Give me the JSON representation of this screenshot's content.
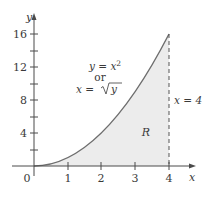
{
  "figure": {
    "colors": {
      "axis": "#4a4a4a",
      "curve": "#6e6e6e",
      "fill": "#ececec",
      "dashed_line": "#555555",
      "text": "#3a3a3a"
    },
    "axes": {
      "x_label": "x",
      "y_label": "y",
      "origin_label": "0",
      "x_ticks": [
        {
          "value": 1,
          "label": "1"
        },
        {
          "value": 2,
          "label": "2"
        },
        {
          "value": 3,
          "label": "3"
        },
        {
          "value": 4,
          "label": "4"
        }
      ],
      "y_ticks": [
        {
          "value": 4,
          "label": "4"
        },
        {
          "value": 8,
          "label": "8"
        },
        {
          "value": 12,
          "label": "12"
        },
        {
          "value": 16,
          "label": "16"
        }
      ],
      "y_minor_ticks": [
        2,
        6,
        10,
        14
      ],
      "x_range": [
        0,
        4
      ],
      "y_range": [
        0,
        16
      ]
    },
    "curve": {
      "equation_line1": "y = x",
      "equation_line1_exp": "2",
      "equation_or": "or",
      "equation_line2_left": "x = ",
      "equation_line2_root": "y",
      "domain": [
        0,
        4
      ]
    },
    "boundary": {
      "label": "x = 4",
      "x": 4
    },
    "region": {
      "label": "R"
    }
  }
}
